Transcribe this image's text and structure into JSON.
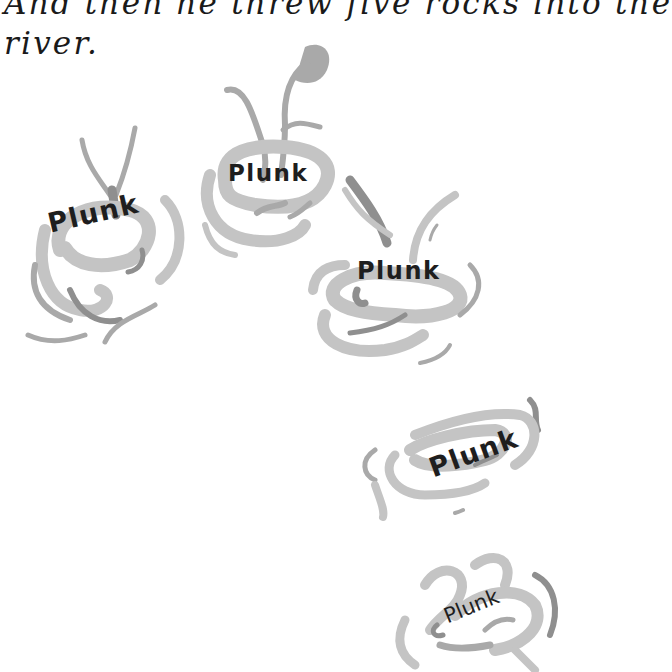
{
  "page": {
    "story_lines": [
      "And then he threw five rocks into the",
      "river."
    ]
  },
  "splashes": [
    {
      "label": "Plunk",
      "rotation_deg": -13
    },
    {
      "label": "Plunk",
      "rotation_deg": 0
    },
    {
      "label": "Plunk",
      "rotation_deg": 0
    },
    {
      "label": "Plunk",
      "rotation_deg": -20
    },
    {
      "label": "Plunk",
      "rotation_deg": -22
    }
  ],
  "colors": {
    "text": "#1a1a1a",
    "splash_light": "#c4c4c4",
    "splash_mid": "#a9a9a9",
    "splash_dark": "#8f8f8f",
    "background": "#ffffff"
  }
}
